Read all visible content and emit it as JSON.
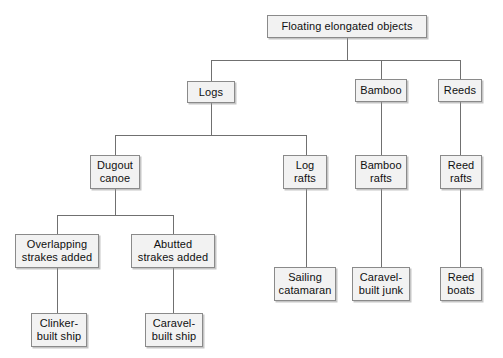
{
  "diagram": {
    "type": "tree-diagram",
    "orientation": "top-down",
    "background_color": "#ffffff",
    "node_fill_color": "#f2f2f2",
    "node_border_color": "#8a8a8a",
    "edge_color": "#707070",
    "text_color": "#101010",
    "nodes": [
      {
        "id": "root",
        "label": "Floating elongated objects",
        "x": 267,
        "y": 15,
        "w": 160,
        "h": 23,
        "level": 0
      },
      {
        "id": "logs",
        "label": "Logs",
        "x": 187,
        "y": 81,
        "w": 48,
        "h": 22,
        "level": 1
      },
      {
        "id": "bamboo",
        "label": "Bamboo",
        "x": 355,
        "y": 79,
        "w": 52,
        "h": 23,
        "level": 1
      },
      {
        "id": "reeds",
        "label": "Reeds",
        "x": 438,
        "y": 79,
        "w": 44,
        "h": 23,
        "level": 1
      },
      {
        "id": "dugout-canoe",
        "label": "Dugout\ncanoe",
        "x": 90,
        "y": 155,
        "w": 50,
        "h": 34,
        "level": 2
      },
      {
        "id": "log-rafts",
        "label": "Log\nrafts",
        "x": 283,
        "y": 155,
        "w": 44,
        "h": 34,
        "level": 2
      },
      {
        "id": "bamboo-rafts",
        "label": "Bamboo\nrafts",
        "x": 355,
        "y": 155,
        "w": 52,
        "h": 34,
        "level": 2
      },
      {
        "id": "reed-rafts",
        "label": "Reed\nrafts",
        "x": 440,
        "y": 155,
        "w": 42,
        "h": 34,
        "level": 2
      },
      {
        "id": "overlapping",
        "label": "Overlapping\nstrakes added",
        "x": 15,
        "y": 234,
        "w": 84,
        "h": 34,
        "level": 3
      },
      {
        "id": "abutted",
        "label": "Abutted\nstrakes added",
        "x": 131,
        "y": 234,
        "w": 84,
        "h": 34,
        "level": 3
      },
      {
        "id": "sailing-catamaran",
        "label": "Sailing\ncatamaran",
        "x": 274,
        "y": 267,
        "w": 62,
        "h": 34,
        "level": 3
      },
      {
        "id": "caravel-junk",
        "label": "Caravel-\nbuilt junk",
        "x": 352,
        "y": 267,
        "w": 58,
        "h": 34,
        "level": 3
      },
      {
        "id": "reed-boats",
        "label": "Reed\nboats",
        "x": 440,
        "y": 267,
        "w": 42,
        "h": 34,
        "level": 3
      },
      {
        "id": "clinker-ship",
        "label": "Clinker-\nbuilt ship",
        "x": 31,
        "y": 313,
        "w": 56,
        "h": 34,
        "level": 4
      },
      {
        "id": "caravel-ship",
        "label": "Caravel-\nbuilt ship",
        "x": 145,
        "y": 313,
        "w": 58,
        "h": 34,
        "level": 4
      }
    ],
    "edges": [
      {
        "from": "root",
        "to": "logs"
      },
      {
        "from": "root",
        "to": "bamboo"
      },
      {
        "from": "root",
        "to": "reeds"
      },
      {
        "from": "logs",
        "to": "dugout-canoe"
      },
      {
        "from": "logs",
        "to": "log-rafts"
      },
      {
        "from": "bamboo",
        "to": "bamboo-rafts"
      },
      {
        "from": "reeds",
        "to": "reed-rafts"
      },
      {
        "from": "dugout-canoe",
        "to": "overlapping"
      },
      {
        "from": "dugout-canoe",
        "to": "abutted"
      },
      {
        "from": "log-rafts",
        "to": "sailing-catamaran"
      },
      {
        "from": "bamboo-rafts",
        "to": "caravel-junk"
      },
      {
        "from": "reed-rafts",
        "to": "reed-boats"
      },
      {
        "from": "overlapping",
        "to": "clinker-ship"
      },
      {
        "from": "abutted",
        "to": "caravel-ship"
      }
    ],
    "segments": [
      {
        "name": "root-stem",
        "dir": "v",
        "x": 347,
        "y": 38,
        "len": 22
      },
      {
        "name": "level1-bus",
        "dir": "h",
        "x": 211,
        "y": 60,
        "len": 249
      },
      {
        "name": "logs-drop",
        "dir": "v",
        "x": 211,
        "y": 60,
        "len": 21
      },
      {
        "name": "bamboo-drop",
        "dir": "v",
        "x": 381,
        "y": 60,
        "len": 19
      },
      {
        "name": "reeds-drop",
        "dir": "v",
        "x": 460,
        "y": 60,
        "len": 19
      },
      {
        "name": "logs-stem",
        "dir": "v",
        "x": 211,
        "y": 103,
        "len": 32
      },
      {
        "name": "logs-bus",
        "dir": "h",
        "x": 115,
        "y": 135,
        "len": 191
      },
      {
        "name": "dugout-drop",
        "dir": "v",
        "x": 115,
        "y": 135,
        "len": 20
      },
      {
        "name": "lografts-drop",
        "dir": "v",
        "x": 306,
        "y": 135,
        "len": 20
      },
      {
        "name": "dugout-stem",
        "dir": "v",
        "x": 115,
        "y": 189,
        "len": 26
      },
      {
        "name": "dugout-bus",
        "dir": "h",
        "x": 57,
        "y": 215,
        "len": 116
      },
      {
        "name": "overlapping-drop",
        "dir": "v",
        "x": 57,
        "y": 215,
        "len": 19
      },
      {
        "name": "abutted-drop",
        "dir": "v",
        "x": 173,
        "y": 215,
        "len": 19
      },
      {
        "name": "overlapping-clinker",
        "dir": "v",
        "x": 57,
        "y": 268,
        "len": 45
      },
      {
        "name": "abutted-caravel",
        "dir": "v",
        "x": 173,
        "y": 268,
        "len": 45
      },
      {
        "name": "lografts-sailing",
        "dir": "v",
        "x": 306,
        "y": 189,
        "len": 78
      },
      {
        "name": "bamboo-bambooraft",
        "dir": "v",
        "x": 381,
        "y": 102,
        "len": 53
      },
      {
        "name": "bambooraft-junk",
        "dir": "v",
        "x": 381,
        "y": 189,
        "len": 78
      },
      {
        "name": "reeds-reedraft",
        "dir": "v",
        "x": 460,
        "y": 102,
        "len": 53
      },
      {
        "name": "reedraft-reedboats",
        "dir": "v",
        "x": 460,
        "y": 189,
        "len": 78
      }
    ]
  }
}
